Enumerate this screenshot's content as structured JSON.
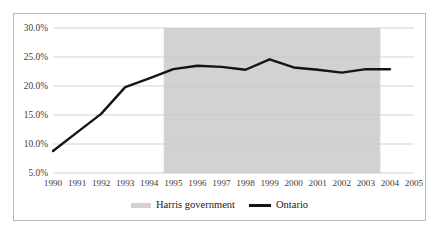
{
  "chart_data": {
    "type": "line",
    "title": "",
    "subtitle": "",
    "xlabel": "",
    "ylabel": "",
    "x": [
      1990,
      1991,
      1992,
      1993,
      1994,
      1995,
      1996,
      1997,
      1998,
      1999,
      2000,
      2001,
      2002,
      2003,
      2004
    ],
    "xtick_labels": [
      "1990",
      "1991",
      "1992",
      "1993",
      "1994",
      "1995",
      "1996",
      "1997",
      "1998",
      "1999",
      "2000",
      "2001",
      "2002",
      "2003",
      "2004",
      "2005"
    ],
    "xlim": [
      1990,
      2005
    ],
    "ylim": [
      5.0,
      30.0
    ],
    "ytick_labels": [
      "5.0%",
      "10.0%",
      "15.0%",
      "20.0%",
      "25.0%",
      "30.0%"
    ],
    "ytick_values": [
      5.0,
      10.0,
      15.0,
      20.0,
      25.0,
      30.0
    ],
    "grid": true,
    "legend_position": "bottom-center",
    "series": [
      {
        "name": "Ontario",
        "color": "#141414",
        "values": [
          8.8,
          12.0,
          15.2,
          19.8,
          21.3,
          22.9,
          23.5,
          23.3,
          22.8,
          24.6,
          23.2,
          22.8,
          22.3,
          22.9,
          22.9
        ]
      }
    ],
    "shaded_region": {
      "name": "Harris government",
      "color": "#d2d2d2",
      "x_start": 1994.6,
      "x_end": 2003.6
    },
    "legend": [
      {
        "label": "Harris government",
        "marker": "band",
        "color": "#d2d2d2"
      },
      {
        "label": "Ontario",
        "marker": "line",
        "color": "#141414"
      }
    ]
  }
}
